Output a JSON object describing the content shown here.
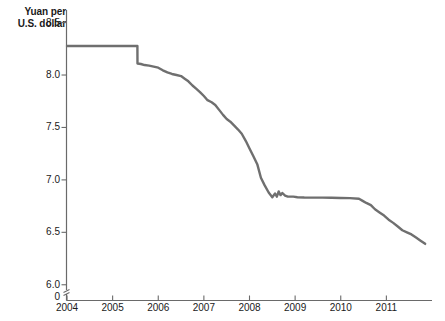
{
  "chart_data": {
    "type": "line",
    "title": "",
    "subtitle": "",
    "ylabel_line1": "Yuan per",
    "ylabel_line2": "U.S. dollar",
    "xlabel": "",
    "grid": false,
    "legend": "none",
    "line_color": "#6f6f6f",
    "axis_color": "#6a6a6a",
    "text_color": "#1a1a1a",
    "axis_break_marker": true,
    "zero_tick_label": "0",
    "ylim": [
      5.95,
      8.62
    ],
    "yticks": [
      8.5,
      8.0,
      7.5,
      7.0,
      6.5,
      6.0
    ],
    "ytick_labels": [
      "8.5",
      "8.0",
      "7.5",
      "7.0",
      "6.5",
      "6.0"
    ],
    "xlim": [
      2004.0,
      2012.0
    ],
    "xticks": [
      2004,
      2005,
      2006,
      2007,
      2008,
      2009,
      2010,
      2011
    ],
    "xtick_labels": [
      "2004",
      "2005",
      "2006",
      "2007",
      "2008",
      "2009",
      "2010",
      "2011"
    ],
    "series": [
      {
        "name": "CNY per USD",
        "x": [
          2004.0,
          2004.25,
          2004.5,
          2004.75,
          2005.0,
          2005.25,
          2005.45,
          2005.543,
          2005.545,
          2005.62,
          2005.7,
          2005.8,
          2005.9,
          2006.0,
          2006.1,
          2006.2,
          2006.3,
          2006.4,
          2006.5,
          2006.58,
          2006.66,
          2006.75,
          2006.83,
          2006.92,
          2007.0,
          2007.08,
          2007.17,
          2007.25,
          2007.33,
          2007.42,
          2007.5,
          2007.58,
          2007.66,
          2007.75,
          2007.83,
          2007.92,
          2008.0,
          2008.08,
          2008.17,
          2008.25,
          2008.33,
          2008.42,
          2008.5,
          2008.56,
          2008.6,
          2008.64,
          2008.68,
          2008.72,
          2008.78,
          2008.84,
          2008.9,
          2008.96,
          2009.05,
          2009.2,
          2009.4,
          2009.6,
          2009.8,
          2010.0,
          2010.2,
          2010.4,
          2010.48,
          2010.56,
          2010.66,
          2010.75,
          2010.85,
          2010.95,
          2011.05,
          2011.15,
          2011.25,
          2011.35,
          2011.45,
          2011.55,
          2011.65,
          2011.75,
          2011.85
        ],
        "y": [
          8.277,
          8.277,
          8.277,
          8.277,
          8.277,
          8.277,
          8.277,
          8.277,
          8.11,
          8.105,
          8.095,
          8.09,
          8.08,
          8.07,
          8.045,
          8.025,
          8.01,
          8.0,
          7.99,
          7.965,
          7.94,
          7.9,
          7.87,
          7.835,
          7.8,
          7.76,
          7.74,
          7.715,
          7.67,
          7.62,
          7.58,
          7.555,
          7.52,
          7.48,
          7.44,
          7.37,
          7.3,
          7.23,
          7.15,
          7.02,
          6.95,
          6.88,
          6.835,
          6.87,
          6.84,
          6.89,
          6.855,
          6.875,
          6.85,
          6.84,
          6.84,
          6.84,
          6.835,
          6.832,
          6.831,
          6.831,
          6.83,
          6.828,
          6.826,
          6.82,
          6.8,
          6.78,
          6.76,
          6.72,
          6.69,
          6.66,
          6.62,
          6.59,
          6.555,
          6.52,
          6.5,
          6.48,
          6.45,
          6.42,
          6.39
        ]
      }
    ]
  }
}
